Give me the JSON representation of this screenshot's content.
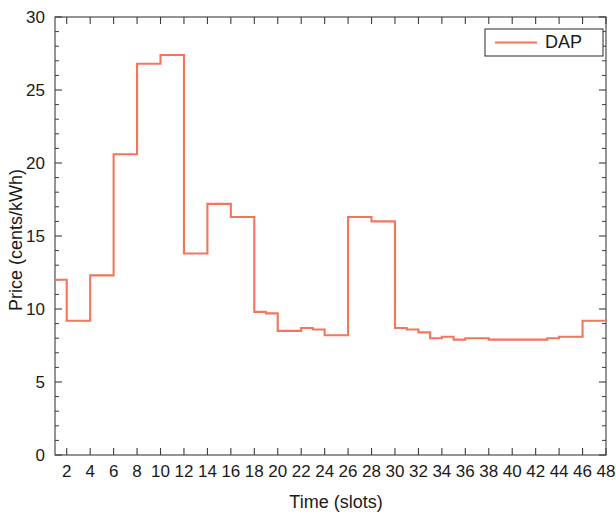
{
  "chart_data": {
    "type": "line",
    "subtype": "stairs",
    "title": "",
    "xlabel": "Time (slots)",
    "ylabel": "Price (cents/kWh)",
    "xlim": [
      1,
      48
    ],
    "ylim": [
      0,
      30
    ],
    "xticks": [
      2,
      4,
      6,
      8,
      10,
      12,
      14,
      16,
      18,
      20,
      22,
      24,
      26,
      28,
      30,
      32,
      34,
      36,
      38,
      40,
      42,
      44,
      46,
      48
    ],
    "yticks": [
      0,
      5,
      10,
      15,
      20,
      25,
      30
    ],
    "xtick_labels": [
      "2",
      "4",
      "6",
      "8",
      "10",
      "12",
      "14",
      "16",
      "18",
      "20",
      "22",
      "24",
      "26",
      "28",
      "30",
      "32",
      "34",
      "36",
      "38",
      "40",
      "42",
      "44",
      "46",
      "48"
    ],
    "ytick_labels": [
      "0",
      "5",
      "10",
      "15",
      "20",
      "25",
      "30"
    ],
    "grid": false,
    "legend_position": "top-right",
    "series": [
      {
        "name": "DAP",
        "color": "#f4745c",
        "x": [
          1,
          2,
          3,
          4,
          5,
          6,
          7,
          8,
          9,
          10,
          11,
          12,
          13,
          14,
          15,
          16,
          17,
          18,
          19,
          20,
          21,
          22,
          23,
          24,
          25,
          26,
          27,
          28,
          29,
          30,
          31,
          32,
          33,
          34,
          35,
          36,
          37,
          38,
          39,
          40,
          41,
          42,
          43,
          44,
          45,
          46,
          47,
          48
        ],
        "values": [
          12.0,
          12.0,
          9.2,
          9.2,
          12.3,
          12.3,
          20.6,
          20.6,
          26.8,
          26.8,
          27.4,
          27.4,
          13.8,
          13.8,
          17.2,
          17.2,
          16.3,
          16.3,
          9.8,
          9.7,
          8.5,
          8.5,
          8.7,
          8.6,
          8.2,
          8.2,
          16.3,
          16.3,
          16.0,
          16.0,
          8.7,
          8.6,
          8.4,
          8.0,
          8.1,
          7.9,
          8.0,
          8.0,
          7.9,
          7.9,
          7.9,
          7.9,
          7.9,
          8.0,
          8.1,
          8.1,
          9.2,
          9.2
        ]
      }
    ]
  },
  "legend": {
    "entries": [
      {
        "label": "DAP",
        "color": "#f4745c"
      }
    ]
  },
  "axes": {
    "x_title": "Time (slots)",
    "y_title": "Price (cents/kWh)"
  }
}
